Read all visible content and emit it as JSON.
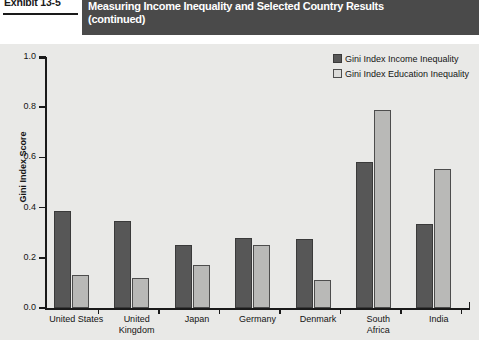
{
  "header": {
    "exhibit_label": "Exhibit 13-5",
    "title": "Measuring Income Inequality and Selected Country Results",
    "subtitle": "(continued)",
    "banner_color": "#4a4a4a"
  },
  "legend": {
    "items": [
      {
        "label": "Gini Index Income Inequality",
        "color": "#575757",
        "swatch": "income-swatch"
      },
      {
        "label": "Gini Index Education Inequality",
        "color": "#b9b9b7",
        "swatch": "education-swatch"
      }
    ]
  },
  "axes": {
    "y_title": "Gini Index Score",
    "y_ticks": [
      "0.0",
      "0.2",
      "0.4",
      "0.6",
      "0.8",
      "1.0"
    ],
    "y_min": 0.0,
    "y_max": 1.0
  },
  "chart_data": {
    "type": "bar",
    "title": "Measuring Income Inequality and Selected Country Results",
    "xlabel": "",
    "ylabel": "Gini Index Score",
    "ylim": [
      0.0,
      1.0
    ],
    "ytick_step": 0.2,
    "grid": false,
    "legend_position": "top-right",
    "categories": [
      "United States",
      "United Kingdom",
      "Japan",
      "Germany",
      "Denmark",
      "South Africa",
      "India"
    ],
    "category_lines": [
      [
        "United States"
      ],
      [
        "United",
        "Kingdom"
      ],
      [
        "Japan"
      ],
      [
        "Germany"
      ],
      [
        "Denmark"
      ],
      [
        "South",
        "Africa"
      ],
      [
        "India"
      ]
    ],
    "series": [
      {
        "name": "Gini Index Income Inequality",
        "color": "#575757",
        "values": [
          0.385,
          0.345,
          0.25,
          0.28,
          0.275,
          0.58,
          0.335
        ]
      },
      {
        "name": "Gini Index Education Inequality",
        "color": "#b9b9b7",
        "values": [
          0.13,
          0.12,
          0.17,
          0.25,
          0.11,
          0.79,
          0.555
        ]
      }
    ]
  }
}
